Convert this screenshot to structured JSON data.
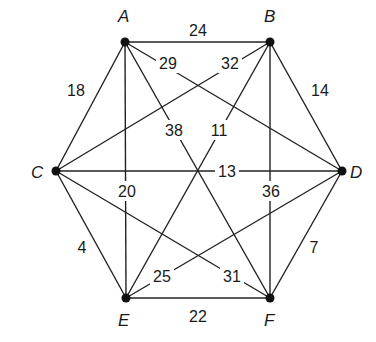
{
  "graph": {
    "title": "",
    "nodes": [
      {
        "id": "A",
        "label": "A",
        "x": 125,
        "y": 42,
        "lx": 118,
        "ly": 22
      },
      {
        "id": "B",
        "label": "B",
        "x": 270,
        "y": 42,
        "lx": 264,
        "ly": 22
      },
      {
        "id": "C",
        "label": "C",
        "x": 56,
        "y": 171,
        "lx": 31,
        "ly": 178
      },
      {
        "id": "D",
        "label": "D",
        "x": 342,
        "y": 171,
        "lx": 350,
        "ly": 178
      },
      {
        "id": "E",
        "label": "E",
        "x": 126,
        "y": 298,
        "lx": 118,
        "ly": 326
      },
      {
        "id": "F",
        "label": "F",
        "x": 270,
        "y": 298,
        "lx": 264,
        "ly": 326
      }
    ],
    "edges": [
      {
        "from": "A",
        "to": "B",
        "weight": "24",
        "wx": 198,
        "wy": 30,
        "bg": false
      },
      {
        "from": "A",
        "to": "C",
        "weight": "18",
        "wx": 76,
        "wy": 90,
        "bg": false
      },
      {
        "from": "A",
        "to": "D",
        "weight": "29",
        "wx": 168,
        "wy": 63,
        "bg": true
      },
      {
        "from": "A",
        "to": "E",
        "weight": "20",
        "wx": 127,
        "wy": 191,
        "bg": true
      },
      {
        "from": "A",
        "to": "F",
        "weight": "38",
        "wx": 174,
        "wy": 130,
        "bg": true
      },
      {
        "from": "B",
        "to": "C",
        "weight": "32",
        "wx": 230,
        "wy": 63,
        "bg": true
      },
      {
        "from": "B",
        "to": "D",
        "weight": "14",
        "wx": 320,
        "wy": 90,
        "bg": false
      },
      {
        "from": "B",
        "to": "E",
        "weight": "11",
        "wx": 219,
        "wy": 130,
        "bg": true
      },
      {
        "from": "B",
        "to": "F",
        "weight": "36",
        "wx": 271,
        "wy": 191,
        "bg": true
      },
      {
        "from": "C",
        "to": "D",
        "weight": "13",
        "wx": 227,
        "wy": 171,
        "bg": true
      },
      {
        "from": "C",
        "to": "E",
        "weight": "4",
        "wx": 82,
        "wy": 247,
        "bg": false
      },
      {
        "from": "C",
        "to": "F",
        "weight": "31",
        "wx": 232,
        "wy": 276,
        "bg": true
      },
      {
        "from": "D",
        "to": "E",
        "weight": "25",
        "wx": 162,
        "wy": 276,
        "bg": true
      },
      {
        "from": "D",
        "to": "F",
        "weight": "7",
        "wx": 314,
        "wy": 247,
        "bg": false
      },
      {
        "from": "E",
        "to": "F",
        "weight": "22",
        "wx": 198,
        "wy": 316,
        "bg": false
      }
    ]
  },
  "colors": {
    "edge": "#222222",
    "node": "#111111",
    "text": "#1a1a1a",
    "background": "#ffffff"
  }
}
